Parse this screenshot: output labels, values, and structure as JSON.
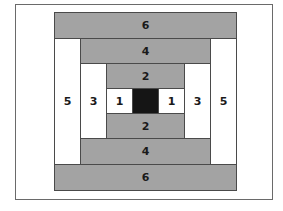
{
  "diagram": {
    "type": "log-cabin-quilt-block",
    "colors": {
      "dark": "#a3a3a3",
      "light": "#ffffff",
      "center": "#151515",
      "outline": "#4a4a4a"
    },
    "pieces": {
      "top_6": "6",
      "top_4": "4",
      "top_2": "2",
      "left_5": "5",
      "left_3": "3",
      "left_1": "1",
      "right_1": "1",
      "right_3": "3",
      "right_5": "5",
      "bottom_2": "2",
      "bottom_4": "4",
      "bottom_6": "6"
    }
  }
}
